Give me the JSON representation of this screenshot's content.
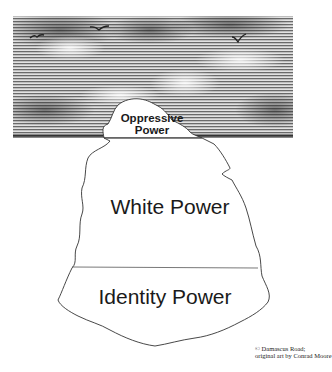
{
  "diagram": {
    "type": "iceberg",
    "layers": [
      {
        "id": "tip",
        "label_lines": [
          "Oppressive",
          "Power"
        ],
        "position": "above waterline"
      },
      {
        "id": "middle",
        "label": "White Power",
        "position": "below waterline"
      },
      {
        "id": "base",
        "label": "Identity Power",
        "position": "below waterline, bottom"
      }
    ],
    "scene": {
      "sky": "hatched gray sky with clouds",
      "birds": 3
    },
    "credit": {
      "line1": "© Damascus Road;",
      "line2": "original art by Conrad Moore"
    },
    "colors": {
      "sky_dark": "#4a4a4a",
      "sky_light": "#d8d8d8",
      "outline": "#333333",
      "ice_fill": "#ffffff",
      "text": "#1a1a1a"
    }
  }
}
